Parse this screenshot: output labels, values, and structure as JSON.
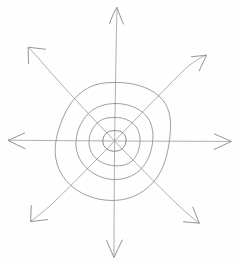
{
  "canvas": {
    "width": 238,
    "height": 264,
    "background_color": "#fefefe",
    "media": "pencil-sketch",
    "description": "Hand-drawn sketch of four concentric rings with eight arrows radiating outward"
  },
  "style": {
    "ring_stroke_color": "#8d8d93",
    "axis_stroke_color": "#9a9aa0",
    "arrowhead_stroke_color": "#85858b",
    "stroke_width": 0.85
  },
  "figure": {
    "center": {
      "x": 114,
      "y": 141
    },
    "ring_count": 4,
    "arrow_count": 8
  },
  "rings": [
    {
      "name": "ring-1-innermost",
      "rx": 11,
      "ry": 10,
      "label": ""
    },
    {
      "name": "ring-2",
      "rx": 24,
      "ry": 23,
      "label": ""
    },
    {
      "name": "ring-3",
      "rx": 38,
      "ry": 37,
      "label": ""
    },
    {
      "name": "ring-4-outermost",
      "rx": 55,
      "ry": 58,
      "label": ""
    }
  ],
  "arrows": [
    {
      "name": "arrow-north",
      "direction": "N",
      "angle_deg": 90,
      "tip": {
        "x": 117,
        "y": 7
      }
    },
    {
      "name": "arrow-northeast",
      "direction": "NE",
      "angle_deg": 45,
      "tip": {
        "x": 205,
        "y": 55
      }
    },
    {
      "name": "arrow-east",
      "direction": "E",
      "angle_deg": 0,
      "tip": {
        "x": 231,
        "y": 141
      }
    },
    {
      "name": "arrow-southeast",
      "direction": "SE",
      "angle_deg": -45,
      "tip": {
        "x": 199,
        "y": 223
      }
    },
    {
      "name": "arrow-south",
      "direction": "S",
      "angle_deg": -90,
      "tip": {
        "x": 114,
        "y": 258
      }
    },
    {
      "name": "arrow-southwest",
      "direction": "SW",
      "angle_deg": -135,
      "tip": {
        "x": 31,
        "y": 221
      }
    },
    {
      "name": "arrow-west",
      "direction": "W",
      "angle_deg": 180,
      "tip": {
        "x": 8,
        "y": 140
      }
    },
    {
      "name": "arrow-northwest",
      "direction": "NW",
      "angle_deg": 135,
      "tip": {
        "x": 28,
        "y": 47
      }
    }
  ],
  "chart_data": {
    "type": "diagram",
    "title": "",
    "subtitle": "",
    "xlabel": "",
    "ylabel": "",
    "legend": [],
    "annotations": [],
    "grid": false,
    "series": [
      {
        "name": "concentric-rings",
        "kind": "circle",
        "center": [
          114,
          141
        ],
        "radii": [
          10.5,
          23.5,
          37.5,
          56.5
        ]
      },
      {
        "name": "radial-arrows",
        "kind": "vector",
        "origin": [
          114,
          141
        ],
        "angles_deg": [
          90,
          45,
          0,
          -45,
          -90,
          -135,
          180,
          135
        ],
        "tips": [
          [
            117,
            7
          ],
          [
            205,
            55
          ],
          [
            231,
            141
          ],
          [
            199,
            223
          ],
          [
            114,
            258
          ],
          [
            31,
            221
          ],
          [
            8,
            140
          ],
          [
            28,
            47
          ]
        ]
      }
    ]
  }
}
